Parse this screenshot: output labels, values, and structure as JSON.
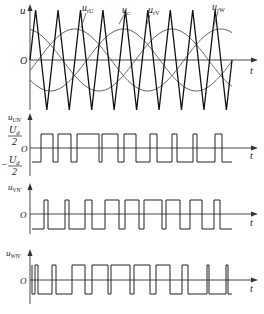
{
  "figure": {
    "top_plot": {
      "y_axis_label": "u",
      "x_axis_label": "t",
      "origin_label": "O",
      "curve_labels": {
        "urU": "u_rU",
        "uc": "u_c",
        "urV": "u_rV",
        "urW": "u_rW"
      },
      "carrier_periods": 9,
      "colors": {
        "carrier": "#111111",
        "reference": "#555555",
        "axis": "#333333"
      }
    },
    "un_plot": {
      "y_axis_label": "u_UN'",
      "x_axis_label": "t",
      "origin_label": "O",
      "pos_level_label": "Ud/2",
      "neg_level_label": "-Ud/2"
    },
    "vn_plot": {
      "y_axis_label": "u_VN'",
      "x_axis_label": "t",
      "origin_label": "O"
    },
    "wn_plot": {
      "y_axis_label": "u_WN'",
      "x_axis_label": "t",
      "origin_label": "O"
    }
  }
}
